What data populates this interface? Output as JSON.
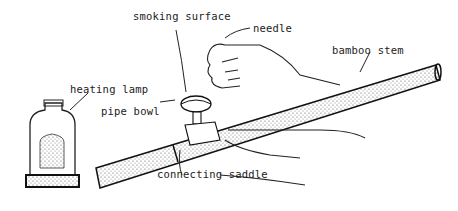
{
  "diagram": {
    "type": "labeled illustration",
    "labels": [
      {
        "id": "smoking_surface",
        "text": "smoking surface"
      },
      {
        "id": "needle",
        "text": "needle"
      },
      {
        "id": "bamboo_stem",
        "text": "bamboo stem"
      },
      {
        "id": "heating_lamp",
        "text": "heating lamp"
      },
      {
        "id": "pipe_bowl",
        "text": "pipe bowl"
      },
      {
        "id": "connecting_saddle",
        "text": "connecting saddle"
      }
    ]
  }
}
